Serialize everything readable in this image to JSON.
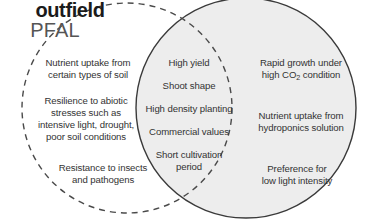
{
  "diagram": {
    "type": "venn",
    "title_left": "outfield",
    "title_right": "PFAL",
    "colors": {
      "right_circle_fill": "#ededed",
      "right_circle_stroke": "#3a3a3a",
      "left_circle_stroke": "#4a4a4a",
      "text": "#333333",
      "title_left_color": "#1b1b1b",
      "title_right_color": "#555555",
      "background": "#ffffff"
    },
    "left_only_items": [
      "Nutrient uptake from\ncertain types of soil",
      "Resilience to abiotic\nstresses such as\nintensive light, drought,\npoor soil conditions",
      "Resistance to insects\nand pathogens"
    ],
    "overlap_items": [
      "High yield",
      "Shoot shape",
      "High density planting",
      "Commercial values",
      "Short cultivation\nperiod"
    ],
    "right_only_items": [
      "Rapid growth under\nhigh CO2 condition",
      "Nutrient uptake from\nhydroponics solution",
      "Preference for\nlow light intensity"
    ],
    "right_only_items_plain": {
      "rapid_growth_line1": "Rapid growth under",
      "rapid_growth_line2_pre": "high CO",
      "rapid_growth_line2_sub": "2",
      "rapid_growth_line2_post": " condition"
    }
  }
}
